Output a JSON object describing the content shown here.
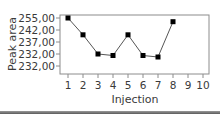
{
  "chart_data": {
    "type": "line",
    "title": "",
    "xlabel": "Injection",
    "ylabel": "Peak area",
    "x": [
      1,
      2,
      3,
      4,
      5,
      6,
      7,
      8
    ],
    "x_ticks": [
      "1",
      "2",
      "3",
      "4",
      "5",
      "6",
      "7",
      "8",
      "9",
      "10"
    ],
    "y_ticks": [
      "255,00",
      "242,00",
      "237,00",
      "232,00",
      "232,00"
    ],
    "series": [
      {
        "name": "Peak area",
        "marker": "square",
        "color": "#000000",
        "values": [
          255,
          240,
          232,
          231.5,
          240,
          231.5,
          231,
          251
        ]
      }
    ],
    "xlim": [
      0.5,
      10.5
    ],
    "grid": false,
    "legend": "none"
  },
  "colors": {
    "frame": "#8c8c8c",
    "line": "#555555",
    "marker": "#000000",
    "text": "#3a3a3a"
  }
}
